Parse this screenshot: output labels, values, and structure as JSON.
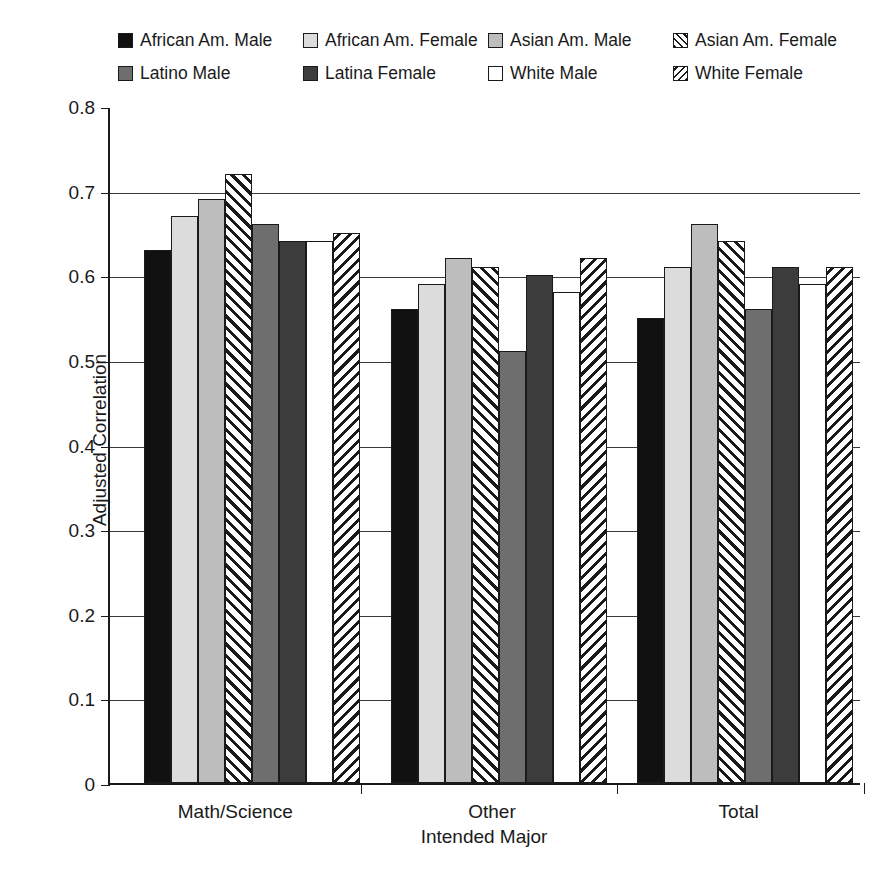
{
  "chart_data": {
    "type": "bar",
    "title": "",
    "xlabel": "Intended Major",
    "ylabel": "Adjusted Correlation",
    "categories": [
      "Math/Science",
      "Other",
      "Total"
    ],
    "ylim": [
      0,
      0.8
    ],
    "ytick_labels": [
      "0",
      "0.1",
      "0.2",
      "0.3",
      "0.4",
      "0.5",
      "0.6",
      "0.7",
      "0.8"
    ],
    "ytick_values": [
      0,
      0.1,
      0.2,
      0.3,
      0.4,
      0.5,
      0.6,
      0.7,
      0.8
    ],
    "grid": "horizontal",
    "legend_position": "top",
    "series": [
      {
        "name": "African Am. Male",
        "fill": "solid-black",
        "values": [
          0.63,
          0.56,
          0.55
        ]
      },
      {
        "name": "African Am. Female",
        "fill": "solid-light-gray",
        "values": [
          0.67,
          0.59,
          0.61
        ]
      },
      {
        "name": "Asian Am. Male",
        "fill": "solid-med-gray",
        "values": [
          0.69,
          0.62,
          0.66
        ]
      },
      {
        "name": "Asian Am. Female",
        "fill": "hatch-forward",
        "values": [
          0.72,
          0.61,
          0.64
        ]
      },
      {
        "name": "Latino Male",
        "fill": "solid-gray",
        "values": [
          0.66,
          0.51,
          0.56
        ]
      },
      {
        "name": "Latina Female",
        "fill": "solid-dark-gray",
        "values": [
          0.64,
          0.6,
          0.61
        ]
      },
      {
        "name": "White Male",
        "fill": "solid-white",
        "values": [
          0.64,
          0.58,
          0.59
        ]
      },
      {
        "name": "White Female",
        "fill": "hatch-backward",
        "values": [
          0.65,
          0.62,
          0.61
        ]
      }
    ]
  },
  "colors": {
    "solid-black": "#111111",
    "solid-light-gray": "#dcdcdc",
    "solid-med-gray": "#bdbdbd",
    "solid-gray": "#6e6e6e",
    "solid-dark-gray": "#3c3c3c",
    "solid-white": "#ffffff",
    "hatch-line": "#1a1a1a",
    "axis": "#1a1a1a",
    "background": "#ffffff"
  }
}
